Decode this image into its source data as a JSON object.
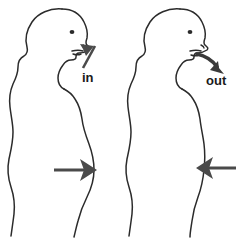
{
  "diagram": {
    "background_color": "#ffffff",
    "outline_color": "#2b2b2b",
    "arrow_color": "#4a4a4a",
    "label_color": "#1a1a1a",
    "figures": [
      {
        "id": "inhale-figure",
        "name": "Inhale figure",
        "phase": "inhale",
        "label": "in",
        "airflow_direction": "into-nose",
        "abdomen_state": "expanded",
        "abdomen_arrow_direction": "outward-right",
        "side": "left"
      },
      {
        "id": "exhale-figure",
        "name": "Exhale figure",
        "phase": "exhale",
        "label": "out",
        "airflow_direction": "out-of-mouth",
        "abdomen_state": "contracted",
        "abdomen_arrow_direction": "inward-left",
        "side": "right"
      }
    ],
    "labels": {
      "in": "in",
      "out": "out"
    }
  }
}
